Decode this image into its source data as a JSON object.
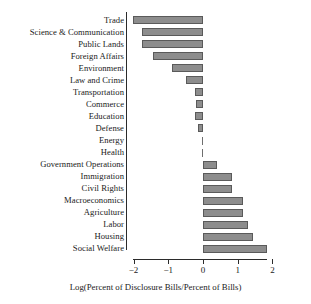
{
  "chart_data": {
    "type": "bar",
    "orientation": "horizontal",
    "title": "",
    "xlabel": "Log(Percent of Disclosure Bills/Percent of Bills)",
    "ylabel": "",
    "xlim": [
      -2.3,
      2.0
    ],
    "xticks": [
      -2,
      -1,
      0,
      1,
      2
    ],
    "xtick_labels": [
      "−2",
      "−1",
      "0",
      "1",
      "2"
    ],
    "grid": false,
    "legend": "none",
    "bar_color": "#8d8d8d",
    "bar_edge_color": "#5a5a5a",
    "axis_color": "#2b2b2b",
    "categories": [
      "Trade",
      "Science & Communication",
      "Public Lands",
      "Foreign Affairs",
      "Environment",
      "Law and Crime",
      "Transportation",
      "Commerce",
      "Education",
      "Defense",
      "Energy",
      "Health",
      "Government Operations",
      "Immigration",
      "Civil Rights",
      "Macroeconomics",
      "Agriculture",
      "Labor",
      "Housing",
      "Social Welfare"
    ],
    "values": [
      -2.02,
      -1.77,
      -1.77,
      -1.45,
      -0.9,
      -0.5,
      -0.24,
      -0.2,
      -0.22,
      -0.13,
      -0.06,
      -0.01,
      0.41,
      0.85,
      0.85,
      1.14,
      1.14,
      1.31,
      1.45,
      1.83
    ]
  }
}
